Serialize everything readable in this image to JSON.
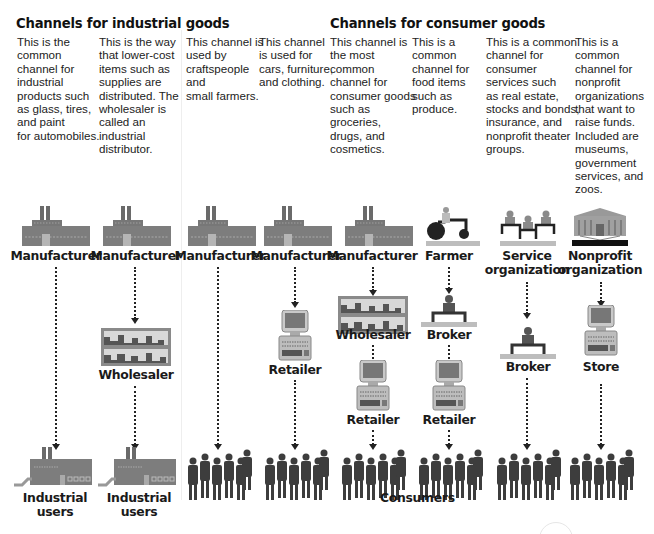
{
  "titles": {
    "industrial": "Channels for industrial goods",
    "consumer": "Channels for consumer goods"
  },
  "descriptions": [
    "This is the\ncommon\nchannel for\nindustrial\nproducts such\nas glass, tires,\nand paint\nfor automobiles.",
    "This is the way\nthat lower-cost\nitems such as\nsupplies are\ndistributed. The\nwholesaler is\ncalled an\nindustrial\ndistributor.",
    "This channel is\nused by\ncraftspeople\nand\nsmall farmers.",
    "This channel\nis used for\ncars, furniture,\nand clothing.",
    "This channel is\nthe most\ncommon\nchannel for\nconsumer goods\nsuch as\ngroceries,\ndrugs, and\ncosmetics.",
    "This is a\ncommon\nchannel for\nfood items\nsuch as\nproduce.",
    "This is a common\nchannel for\nconsumer\nservices such\nas real estate,\nstocks and bonds,\ninsurance, and\nnonprofit theater\ngroups.",
    "This is a\ncommon\nchannel for\nnonprofit\norganizations\nthat want to\nraise funds.\nIncluded are\nmuseums,\ngovernment\nservices, and\nzoos."
  ],
  "channels": [
    {
      "nodes": [
        "Manufacturer",
        "Industrial\nusers"
      ]
    },
    {
      "nodes": [
        "Manufacturer",
        "Wholesaler",
        "Industrial\nusers"
      ]
    },
    {
      "nodes": [
        "Manufacturer"
      ]
    },
    {
      "nodes": [
        "Manufacturer",
        "Retailer"
      ]
    },
    {
      "nodes": [
        "Manufacturer",
        "Wholesaler",
        "Retailer"
      ]
    },
    {
      "nodes": [
        "Farmer",
        "Broker",
        "Retailer"
      ]
    },
    {
      "nodes": [
        "Service\norganization",
        "Broker"
      ]
    },
    {
      "nodes": [
        "Nonprofit\norganization",
        "Store"
      ]
    }
  ],
  "labels": {
    "manufacturer": "Manufacturer",
    "wholesaler": "Wholesaler",
    "retailer": "Retailer",
    "farmer": "Farmer",
    "broker": "Broker",
    "service_org": "Service\norganization",
    "nonprofit_org": "Nonprofit\norganization",
    "store": "Store",
    "industrial_users": "Industrial\nusers",
    "consumers": "Consumers"
  },
  "colors": {
    "building": "#7a7a7a",
    "building_dark": "#555555",
    "screen": "#8a8a8a",
    "people": "#4a4a4a",
    "platform": "#b8b8b8",
    "text": "#1a1a1a"
  }
}
